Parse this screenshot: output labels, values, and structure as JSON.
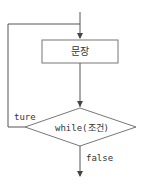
{
  "diagram": {
    "type": "flowchart",
    "title": "",
    "nodes": [
      {
        "id": "statement",
        "shape": "rectangle",
        "label": "문장"
      },
      {
        "id": "condition",
        "shape": "diamond",
        "label": "while(조건)"
      }
    ],
    "edges": [
      {
        "from": "start",
        "to": "statement",
        "label": ""
      },
      {
        "from": "statement",
        "to": "condition",
        "label": ""
      },
      {
        "from": "condition",
        "to": "statement",
        "label": "ture"
      },
      {
        "from": "condition",
        "to": "end",
        "label": "false"
      }
    ],
    "labels": {
      "statement": "문장",
      "condition": "while(조건)",
      "true_branch": "ture",
      "false_branch": "false"
    },
    "colors": {
      "line": "#555555",
      "box_border": "#777777",
      "text": "#333333",
      "background": "#ffffff"
    }
  }
}
